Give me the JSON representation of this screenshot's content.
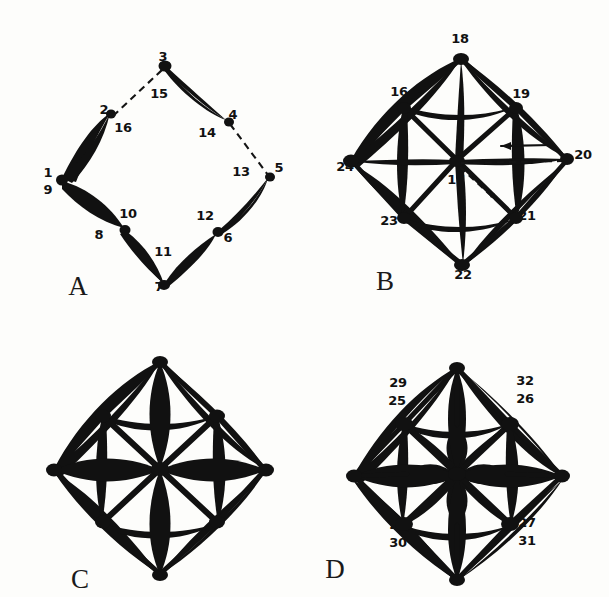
{
  "figure": {
    "caption_letters": [
      "A",
      "B",
      "C",
      "D"
    ],
    "ink_color": "#111111",
    "background_color": "#fdfdfb",
    "style": "hand-drawn ink diagram of four octahedral (diamond) projections"
  },
  "panels": {
    "a": {
      "letter": "A",
      "vertex_labels": [
        "3",
        "2",
        "4",
        "1",
        "9",
        "5",
        "8",
        "6",
        "7"
      ],
      "edge_labels": [
        "15",
        "16",
        "14",
        "13",
        "10",
        "12",
        "11"
      ],
      "dashed_edges": [
        "2-3",
        "4-5"
      ],
      "labels": [
        {
          "text": "3",
          "x": 163,
          "y": 57
        },
        {
          "text": "2",
          "x": 104,
          "y": 110
        },
        {
          "text": "4",
          "x": 233,
          "y": 115
        },
        {
          "text": "5",
          "x": 279,
          "y": 168
        },
        {
          "text": "1",
          "x": 48,
          "y": 173
        },
        {
          "text": "9",
          "x": 48,
          "y": 189
        },
        {
          "text": "8",
          "x": 99,
          "y": 235
        },
        {
          "text": "6",
          "x": 228,
          "y": 238
        },
        {
          "text": "7",
          "x": 159,
          "y": 287
        },
        {
          "text": "15",
          "x": 159,
          "y": 94
        },
        {
          "text": "16",
          "x": 123,
          "y": 128
        },
        {
          "text": "14",
          "x": 207,
          "y": 133
        },
        {
          "text": "13",
          "x": 241,
          "y": 172
        },
        {
          "text": "10",
          "x": 128,
          "y": 214
        },
        {
          "text": "12",
          "x": 205,
          "y": 216
        },
        {
          "text": "11",
          "x": 163,
          "y": 252
        }
      ],
      "letter_pos": {
        "x": 78,
        "y": 286
      }
    },
    "b": {
      "letter": "B",
      "vertex_labels": [
        "18",
        "16",
        "19",
        "24",
        "17",
        "20",
        "23",
        "21",
        "22"
      ],
      "edge_labels": [],
      "dashed_edges": [
        "17-20",
        "17-21"
      ],
      "arrows": [
        "arrow-toward-17-along-17-20",
        "arrow-toward-21-along-17-21"
      ],
      "labels": [
        {
          "text": "18",
          "x": 155,
          "y": 39
        },
        {
          "text": "16",
          "x": 94,
          "y": 92
        },
        {
          "text": "19",
          "x": 216,
          "y": 94
        },
        {
          "text": "24",
          "x": 40,
          "y": 163
        },
        {
          "text": "17",
          "x": 151,
          "y": 172
        },
        {
          "text": "20",
          "x": 266,
          "y": 152
        },
        {
          "text": "23",
          "x": 84,
          "y": 221
        },
        {
          "text": "21",
          "x": 216,
          "y": 216
        },
        {
          "text": "22",
          "x": 158,
          "y": 273
        }
      ],
      "letter_pos": {
        "x": 80,
        "y": 281
      }
    },
    "c": {
      "letter": "C",
      "vertex_labels": [],
      "edge_labels": [],
      "labels": [],
      "letter_pos": {
        "x": 80,
        "y": 280
      }
    },
    "d": {
      "letter": "D",
      "vertex_labels": [
        "29",
        "25",
        "32",
        "26",
        "28",
        "30",
        "27",
        "31"
      ],
      "edge_labels": [],
      "labels": [
        {
          "text": "29",
          "x": 93,
          "y": 84
        },
        {
          "text": "25",
          "x": 92,
          "y": 101
        },
        {
          "text": "32",
          "x": 220,
          "y": 82
        },
        {
          "text": "26",
          "x": 220,
          "y": 99
        },
        {
          "text": "28",
          "x": 93,
          "y": 226
        },
        {
          "text": "30",
          "x": 93,
          "y": 243
        },
        {
          "text": "27",
          "x": 222,
          "y": 224
        },
        {
          "text": "31",
          "x": 222,
          "y": 241
        }
      ],
      "letter_pos": {
        "x": 30,
        "y": 270
      }
    }
  }
}
